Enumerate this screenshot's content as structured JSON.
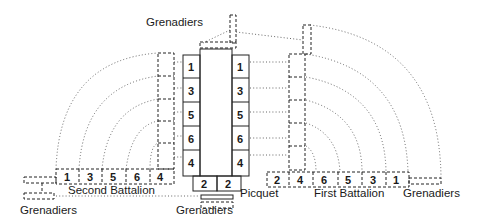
{
  "diagram": {
    "labels": {
      "grenadiers_top": "Grenadiers",
      "second_battalion": "Second Battalion",
      "first_battalion": "First Battalion",
      "picquet": "Picquet",
      "grenadiers_bottom_left": "Grenadiers",
      "grenadiers_bottom_center": "Grenadiers",
      "grenadiers_bottom_right": "Grenadiers"
    },
    "square": {
      "left_column": [
        "1",
        "3",
        "5",
        "6",
        "4"
      ],
      "right_column": [
        "1",
        "3",
        "5",
        "6",
        "4"
      ],
      "rear": [
        "2",
        "2"
      ]
    },
    "second_battalion_line": [
      "1",
      "3",
      "5",
      "6",
      "4"
    ],
    "first_battalion_line": [
      "2",
      "4",
      "6",
      "5",
      "3",
      "1"
    ]
  }
}
